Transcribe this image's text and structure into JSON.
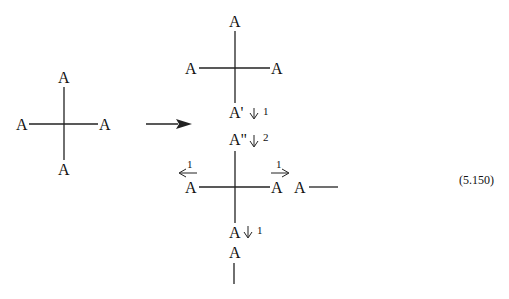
{
  "figure": {
    "left_vertex": {
      "top": "A",
      "left": "A",
      "right": "A",
      "bottom": "A"
    },
    "transition_arrow": "→",
    "right_vertex_1": {
      "top": "A",
      "left": "A",
      "right": "A",
      "bottom": "A'",
      "bottom_arrow_label": "1"
    },
    "intermediate": {
      "label": "A\"",
      "arrow_label": "2"
    },
    "right_vertex_2": {
      "left": "A",
      "left_arrow_label": "1",
      "right": "A",
      "right_arrow_label": "1",
      "far_right": "A",
      "bottom": "A",
      "bottom_arrow_label": "1"
    },
    "tail": {
      "label": "A"
    }
  },
  "equation_number": "(5.150)"
}
